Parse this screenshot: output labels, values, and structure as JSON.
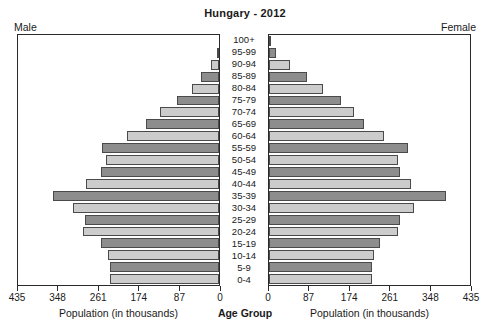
{
  "title": "Hungary - 2012",
  "labels": {
    "male_side": "Male",
    "female_side": "Female",
    "male_axis_caption": "Population (in thousands)",
    "female_axis_caption": "Population (in thousands)",
    "center_caption": "Age Group"
  },
  "colors": {
    "bar_dark": "#8d8d8d",
    "bar_light": "#cccccc",
    "bar_outline": "#4a4a4a",
    "panel_border": "#2a2a2a",
    "text": "#1a1a1a",
    "background": "#ffffff"
  },
  "chart_data": {
    "type": "bar",
    "subtype": "population-pyramid",
    "title": "Hungary - 2012",
    "xlabel": "Population (in thousands)",
    "ylabel": "Age Group",
    "grid": false,
    "legend": "none",
    "xlim": [
      0,
      435
    ],
    "xticks": [
      0,
      87,
      174,
      261,
      348,
      435
    ],
    "left_xticks": [
      435,
      348,
      261,
      174,
      87,
      0
    ],
    "right_xticks": [
      0,
      87,
      174,
      261,
      348,
      435
    ],
    "categories": [
      "100+",
      "95-99",
      "90-94",
      "85-89",
      "80-84",
      "75-79",
      "70-74",
      "65-69",
      "60-64",
      "55-59",
      "50-54",
      "45-49",
      "40-44",
      "35-39",
      "30-34",
      "25-29",
      "20-24",
      "15-19",
      "10-14",
      "5-9",
      "0-4"
    ],
    "series": [
      {
        "name": "Male",
        "side": "left",
        "values": [
          1,
          5,
          17,
          38,
          59,
          92,
          127,
          158,
          200,
          254,
          245,
          255,
          287,
          360,
          315,
          290,
          295,
          255,
          240,
          235,
          235
        ]
      },
      {
        "name": "Female",
        "side": "right",
        "values": [
          3,
          16,
          45,
          83,
          116,
          155,
          183,
          205,
          248,
          300,
          279,
          283,
          307,
          383,
          313,
          283,
          280,
          241,
          228,
          223,
          222
        ]
      }
    ]
  }
}
